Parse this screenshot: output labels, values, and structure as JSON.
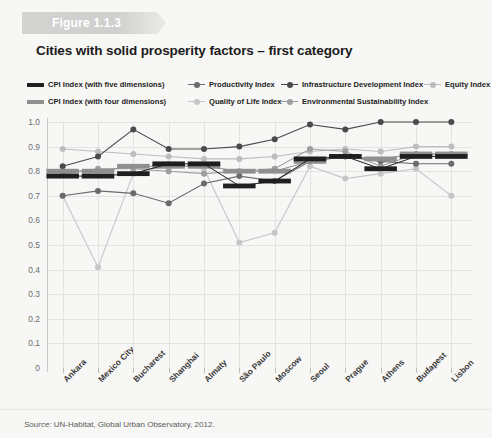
{
  "figure": {
    "ribbon_label": "Figure 1.1.3",
    "title": "Cities with solid prosperity factors – first category",
    "source_prefix": "Source:",
    "source_text": " UN-Habitat, Global Urban Observatory, 2012."
  },
  "colors": {
    "cpi_five": "#1f1f1f",
    "cpi_four": "#8f8f8f",
    "productivity": "#6b6b6b",
    "quality_of_life": "#c6c6c6",
    "infrastructure": "#4a4a4a",
    "environmental": "#9e9e9e",
    "equity": "#bdbdbd",
    "grid": "#e3e3e1",
    "axis": "#c9c9c7",
    "ribbon": "#d3d3d1",
    "background": "#f7f7f5"
  },
  "legend": [
    {
      "label": "CPI Index (with five dimensions)",
      "type": "bar",
      "color": "#1f1f1f",
      "row": 0,
      "x": 0
    },
    {
      "label": "Productivity Index",
      "type": "marker",
      "color": "#6b6b6b",
      "row": 0,
      "x": 161
    },
    {
      "label": "Infrastructure Development Index",
      "type": "marker",
      "color": "#4a4a4a",
      "row": 0,
      "x": 254
    },
    {
      "label": "Equity Index",
      "type": "marker",
      "color": "#bdbdbd",
      "row": 0,
      "x": 397
    },
    {
      "label": "CPI Index (with four dimensions)",
      "type": "bar",
      "color": "#8f8f8f",
      "row": 1,
      "x": 0
    },
    {
      "label": "Quality of Life Index",
      "type": "marker",
      "color": "#c6c6c6",
      "row": 1,
      "x": 161
    },
    {
      "label": "Environmental Sustainability Index",
      "type": "marker",
      "color": "#9e9e9e",
      "row": 1,
      "x": 254
    }
  ],
  "chart_data": {
    "type": "line",
    "title": "Cities with solid prosperity factors – first category",
    "xlabel": "",
    "ylabel": "",
    "ylim": [
      0,
      1.0
    ],
    "ytick_step": 0.1,
    "yticks": [
      "0",
      "0.1",
      "0.2",
      "0.3",
      "0.4",
      "0.5",
      "0.6",
      "0.7",
      "0.8",
      "0.9",
      "1.0"
    ],
    "grid": true,
    "legend_position": "top",
    "categories": [
      "Ankara",
      "Mexico City",
      "Bucharest",
      "Shanghai",
      "Almaty",
      "São Paulo",
      "Moscow",
      "Seoul",
      "Prague",
      "Athens",
      "Budapest",
      "Lisbon"
    ],
    "series": [
      {
        "name": "CPI Index (with five dimensions)",
        "style": "bar",
        "color": "#1f1f1f",
        "values": [
          0.78,
          0.78,
          0.79,
          0.83,
          0.83,
          0.74,
          0.76,
          0.85,
          0.86,
          0.81,
          0.86,
          0.86
        ]
      },
      {
        "name": "CPI Index (with four dimensions)",
        "style": "bar",
        "color": "#8f8f8f",
        "values": [
          0.8,
          0.8,
          0.82,
          0.82,
          0.82,
          0.8,
          0.8,
          0.84,
          0.86,
          0.85,
          0.87,
          0.87
        ]
      },
      {
        "name": "Productivity Index",
        "style": "marker",
        "color": "#6b6b6b",
        "values": [
          0.7,
          0.72,
          0.71,
          0.67,
          0.75,
          0.78,
          0.76,
          0.84,
          0.86,
          0.84,
          0.83,
          0.83
        ]
      },
      {
        "name": "Infrastructure Development Index",
        "style": "marker",
        "color": "#4a4a4a",
        "values": [
          0.82,
          0.86,
          0.97,
          0.89,
          0.89,
          0.9,
          0.93,
          0.99,
          0.97,
          1.0,
          1.0,
          1.0
        ]
      },
      {
        "name": "Quality of Life Index",
        "style": "marker",
        "color": "#c6c6c6",
        "values": [
          0.7,
          0.41,
          0.79,
          0.83,
          0.81,
          0.51,
          0.55,
          0.82,
          0.77,
          0.79,
          0.81,
          0.7
        ]
      },
      {
        "name": "Environmental Sustainability Index",
        "style": "marker",
        "color": "#9e9e9e",
        "values": [
          0.79,
          0.81,
          0.81,
          0.8,
          0.79,
          0.8,
          0.81,
          0.89,
          0.88,
          0.82,
          0.87,
          0.87
        ]
      },
      {
        "name": "Equity Index",
        "style": "marker",
        "color": "#bdbdbd",
        "values": [
          0.89,
          0.88,
          0.87,
          0.86,
          0.85,
          0.85,
          0.86,
          0.88,
          0.89,
          0.88,
          0.9,
          0.9
        ]
      }
    ]
  }
}
